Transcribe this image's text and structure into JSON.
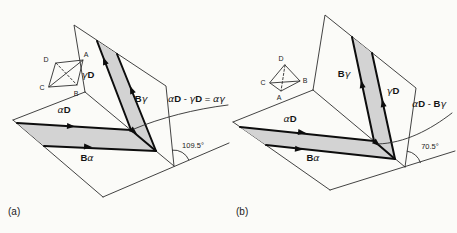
{
  "figure": {
    "colors": {
      "band_fill": "#d3d3d3",
      "thin_line": "#2e2e2e",
      "thick_line": "#0d0d0d",
      "background": "#fbfbf8"
    },
    "panels": {
      "a": {
        "caption": "(a)",
        "angle": "109.5°",
        "reaction": [
          {
            "t": "α",
            "s": "g"
          },
          {
            "t": "D",
            "s": "b"
          },
          {
            "t": " - ",
            "s": "p"
          },
          {
            "t": "γ",
            "s": "g"
          },
          {
            "t": "D",
            "s": "b"
          },
          {
            "t": " = ",
            "s": "p"
          },
          {
            "t": "α",
            "s": "g"
          },
          {
            "t": "γ",
            "s": "g"
          }
        ],
        "labels": {
          "alphaD": [
            {
              "t": "α",
              "s": "g"
            },
            {
              "t": "D",
              "s": "b"
            }
          ],
          "Balpha": [
            {
              "t": "B",
              "s": "b"
            },
            {
              "t": "α",
              "s": "g"
            }
          ],
          "gammaD": [
            {
              "t": "γ",
              "s": "g"
            },
            {
              "t": "D",
              "s": "b"
            }
          ],
          "Bgamma": [
            {
              "t": "B",
              "s": "b"
            },
            {
              "t": "γ",
              "s": "g"
            }
          ]
        },
        "tetrahedron": {
          "D": "D",
          "A": "A",
          "C": "C",
          "B": "B"
        }
      },
      "b": {
        "caption": "(b)",
        "angle": "70.5°",
        "reaction": [
          {
            "t": "α",
            "s": "g"
          },
          {
            "t": "D",
            "s": "b"
          },
          {
            "t": " - ",
            "s": "p"
          },
          {
            "t": "B",
            "s": "b"
          },
          {
            "t": "γ",
            "s": "g"
          }
        ],
        "labels": {
          "alphaD": [
            {
              "t": "α",
              "s": "g"
            },
            {
              "t": "D",
              "s": "b"
            }
          ],
          "Balpha": [
            {
              "t": "B",
              "s": "b"
            },
            {
              "t": "α",
              "s": "g"
            }
          ],
          "gammaD": [
            {
              "t": "γ",
              "s": "g"
            },
            {
              "t": "D",
              "s": "b"
            }
          ],
          "Bgamma": [
            {
              "t": "B",
              "s": "b"
            },
            {
              "t": "γ",
              "s": "g"
            }
          ]
        },
        "tetrahedron": {
          "D": "D",
          "A": "A",
          "C": "C",
          "B": "B"
        }
      }
    }
  }
}
